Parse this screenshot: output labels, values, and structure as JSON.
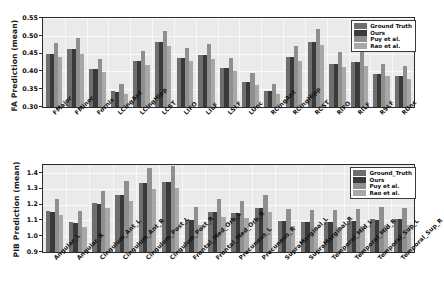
{
  "figure": {
    "background": "#ffffff",
    "panel_background": "#eaeaea"
  },
  "series_colors": {
    "ground_truth": "#6e6e6e",
    "ours": "#3a3a3a",
    "puy": "#8f8f8f",
    "rao": "#a8a8a8"
  },
  "chart_data": [
    {
      "type": "bar",
      "title": "",
      "xlabel": "",
      "ylabel": "FA Prediction (mean)",
      "ylim": [
        0.3,
        0.55
      ],
      "yticks": [
        "0.30",
        "0.35",
        "0.40",
        "0.45",
        "0.50",
        "0.55"
      ],
      "ytick_values": [
        0.3,
        0.35,
        0.4,
        0.45,
        0.5,
        0.55
      ],
      "grid": true,
      "legend_position": "upper right",
      "legend": [
        "Ground Truth",
        "Ours",
        "Puy et al.",
        "Rao et al."
      ],
      "categories": [
        "FMajor",
        "FMinor",
        "Fornix",
        "LCingAnt",
        "LCingHipp",
        "LCST",
        "LIFO",
        "LILF",
        "LSLF",
        "LUnc",
        "RCingAnt",
        "RCingHipp",
        "RCST",
        "RIFO",
        "RILF",
        "RSLF",
        "RUnc"
      ],
      "series": [
        {
          "name": "Ground Truth",
          "values": [
            0.45,
            0.462,
            0.408,
            0.344,
            0.428,
            0.482,
            0.438,
            0.445,
            0.409,
            0.37,
            0.344,
            0.44,
            0.484,
            0.422,
            0.427,
            0.394,
            0.387
          ]
        },
        {
          "name": "Ours",
          "values": [
            0.45,
            0.462,
            0.408,
            0.343,
            0.428,
            0.482,
            0.438,
            0.445,
            0.409,
            0.37,
            0.344,
            0.44,
            0.484,
            0.422,
            0.427,
            0.394,
            0.387
          ]
        },
        {
          "name": "Puy et al.",
          "values": [
            0.481,
            0.493,
            0.436,
            0.366,
            0.456,
            0.514,
            0.467,
            0.477,
            0.439,
            0.396,
            0.365,
            0.471,
            0.518,
            0.454,
            0.456,
            0.422,
            0.414
          ]
        },
        {
          "name": "Rao et al.",
          "values": [
            0.44,
            0.45,
            0.397,
            0.336,
            0.419,
            0.47,
            0.428,
            0.435,
            0.4,
            0.361,
            0.336,
            0.429,
            0.473,
            0.413,
            0.416,
            0.386,
            0.379
          ]
        }
      ]
    },
    {
      "type": "bar",
      "title": "",
      "xlabel": "",
      "ylabel": "PIB Prediction (mean)",
      "ylim": [
        0.9,
        1.45
      ],
      "yticks": [
        "0.9",
        "1.0",
        "1.1",
        "1.2",
        "1.3",
        "1.4"
      ],
      "ytick_values": [
        0.9,
        1.0,
        1.1,
        1.2,
        1.3,
        1.4
      ],
      "grid": true,
      "legend_position": "upper right",
      "legend": [
        "Ground_Truth",
        "Ours",
        "Puy et al.",
        "Rao et al."
      ],
      "categories": [
        "Angular_L",
        "Angular_R",
        "Cingulum_Ant_L",
        "Cingulum_Ant_R",
        "Cingulum_Post_L",
        "Cingulum_Post_R",
        "Frontal_Med_Orb_L",
        "Frontal_Med_Orb_R",
        "Precuneus_L",
        "Precuneus_R",
        "SupraMarginal_L",
        "SupraMarginal_R",
        "Temporal_Mid_L",
        "Temporal_Mid_R",
        "Temporal_Sup_L",
        "Temporal_Sup_R"
      ],
      "series": [
        {
          "name": "Ground_Truth",
          "values": [
            1.16,
            1.087,
            1.209,
            1.262,
            1.337,
            1.345,
            1.102,
            1.155,
            1.148,
            1.181,
            1.096,
            1.091,
            1.09,
            1.097,
            1.107,
            1.108
          ]
        },
        {
          "name": "Ours",
          "values": [
            1.156,
            1.082,
            1.203,
            1.259,
            1.334,
            1.343,
            1.1,
            1.153,
            1.144,
            1.178,
            1.094,
            1.089,
            1.089,
            1.095,
            1.104,
            1.106
          ]
        },
        {
          "name": "Puy et al.",
          "values": [
            1.236,
            1.157,
            1.286,
            1.347,
            1.434,
            1.441,
            1.183,
            1.232,
            1.224,
            1.261,
            1.17,
            1.168,
            1.165,
            1.169,
            1.183,
            1.18
          ]
        },
        {
          "name": "Rao et al.",
          "values": [
            1.131,
            1.057,
            1.178,
            1.225,
            1.298,
            1.307,
            1.073,
            1.124,
            1.114,
            1.155,
            1.065,
            1.061,
            1.061,
            1.067,
            1.072,
            1.073
          ]
        }
      ]
    }
  ]
}
